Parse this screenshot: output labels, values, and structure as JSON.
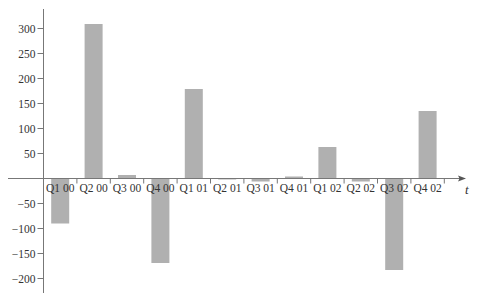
{
  "chart_data": {
    "type": "bar",
    "title": "",
    "xlabel": "t",
    "ylabel": "",
    "categories": [
      "Q1 00",
      "Q2 00",
      "Q3 00",
      "Q4 00",
      "Q1 01",
      "Q2 01",
      "Q3 01",
      "Q4 01",
      "Q1 02",
      "Q2 02",
      "Q3 02",
      "Q4 02"
    ],
    "values": [
      -90,
      309,
      7,
      -169,
      179,
      -1,
      -6,
      4,
      63,
      -6,
      -183,
      135
    ],
    "yticks": [
      -200,
      -150,
      -100,
      -50,
      50,
      100,
      150,
      200,
      250,
      300
    ],
    "ytick_labels": [
      "−200",
      "−150",
      "−100",
      "−50",
      "50",
      "100",
      "150",
      "200",
      "250",
      "300"
    ],
    "ylim": [
      -230,
      340
    ],
    "grid": false,
    "legend": null,
    "bar_color": "#b0b0b0",
    "axis_color": "#777777"
  }
}
